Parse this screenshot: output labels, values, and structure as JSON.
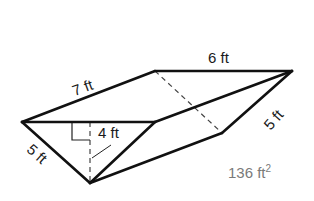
{
  "diagram": {
    "type": "triangular-prism",
    "vertices": {
      "front_left": [
        22,
        122
      ],
      "front_right": [
        155,
        122
      ],
      "front_bottom": [
        90,
        183
      ],
      "back_left": [
        155,
        71
      ],
      "back_right": [
        292,
        71
      ],
      "back_bottom": [
        222,
        133
      ]
    },
    "labels": {
      "length_top": "7 ft",
      "back_edge": "6 ft",
      "right_slant": "5 ft",
      "left_slant": "5 ft",
      "height": "4 ft",
      "surface_area_value": "136 ft",
      "surface_area_exp": "2"
    },
    "colors": {
      "edge": "#111111",
      "hidden_edge": "#444444",
      "area_text": "#7a7a7a"
    }
  }
}
